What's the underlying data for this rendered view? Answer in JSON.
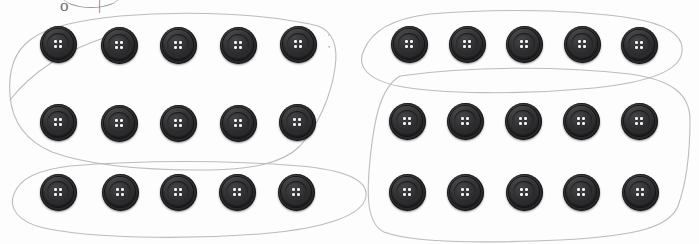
{
  "scene": {
    "title": "Buttons grouping worksheet",
    "description": "Twenty dark four-hole buttons arranged in four rows of five, with faint hand-drawn pencil loops circling groups of buttons",
    "background_color": "#ffffff",
    "width": 699,
    "height": 244
  },
  "colors": {
    "button_body": "#2b2b2d",
    "button_rim": "#333335",
    "button_hole": "#f2f2f2",
    "pencil_line": "#b0b0b0",
    "paper": "#fdfdfd"
  },
  "button_style": {
    "shape": "circle",
    "holes": 4,
    "hole_layout": "2x2",
    "diameter_px": 37
  },
  "handwriting": {
    "visible_fragment": "o     ｜",
    "note": "cut off at top edge of image"
  },
  "annotation_ticks": [
    {
      "name": "tick-right-of-row1-left",
      "x": 327,
      "y": 33,
      "glyph": "ˈ"
    },
    {
      "name": "tick-right-of-row1-left-lower",
      "x": 327,
      "y": 44,
      "glyph": "˺"
    }
  ],
  "button_rows": [
    {
      "name": "left-group-row-1",
      "group": "left",
      "count": 5,
      "y": 44,
      "buttons": [
        {
          "name": "button-l1-1",
          "cx": 58,
          "cy": 44
        },
        {
          "name": "button-l1-2",
          "cx": 119,
          "cy": 45
        },
        {
          "name": "button-l1-3",
          "cx": 178,
          "cy": 45
        },
        {
          "name": "button-l1-4",
          "cx": 238,
          "cy": 45
        },
        {
          "name": "button-l1-5",
          "cx": 298,
          "cy": 44
        }
      ]
    },
    {
      "name": "left-group-row-2",
      "group": "left",
      "count": 5,
      "y": 123,
      "buttons": [
        {
          "name": "button-l2-1",
          "cx": 58,
          "cy": 122
        },
        {
          "name": "button-l2-2",
          "cx": 119,
          "cy": 123
        },
        {
          "name": "button-l2-3",
          "cx": 178,
          "cy": 123
        },
        {
          "name": "button-l2-4",
          "cx": 238,
          "cy": 123
        },
        {
          "name": "button-l2-5",
          "cx": 297,
          "cy": 122
        }
      ]
    },
    {
      "name": "left-group-row-3",
      "group": "left",
      "count": 5,
      "y": 192,
      "buttons": [
        {
          "name": "button-l3-1",
          "cx": 58,
          "cy": 192
        },
        {
          "name": "button-l3-2",
          "cx": 120,
          "cy": 192
        },
        {
          "name": "button-l3-3",
          "cx": 178,
          "cy": 192
        },
        {
          "name": "button-l3-4",
          "cx": 237,
          "cy": 192
        },
        {
          "name": "button-l3-5",
          "cx": 296,
          "cy": 192
        }
      ]
    },
    {
      "name": "right-group-row-1",
      "group": "right",
      "count": 5,
      "y": 44,
      "buttons": [
        {
          "name": "button-r1-1",
          "cx": 409,
          "cy": 44
        },
        {
          "name": "button-r1-2",
          "cx": 467,
          "cy": 44
        },
        {
          "name": "button-r1-3",
          "cx": 524,
          "cy": 44
        },
        {
          "name": "button-r1-4",
          "cx": 582,
          "cy": 44
        },
        {
          "name": "button-r1-5",
          "cx": 639,
          "cy": 45
        }
      ]
    },
    {
      "name": "right-group-row-2",
      "group": "right",
      "count": 5,
      "y": 121,
      "buttons": [
        {
          "name": "button-r2-1",
          "cx": 407,
          "cy": 121
        },
        {
          "name": "button-r2-2",
          "cx": 465,
          "cy": 121
        },
        {
          "name": "button-r2-3",
          "cx": 523,
          "cy": 121
        },
        {
          "name": "button-r2-4",
          "cx": 581,
          "cy": 121
        },
        {
          "name": "button-r2-5",
          "cx": 639,
          "cy": 121
        }
      ]
    },
    {
      "name": "right-group-row-3",
      "group": "right",
      "count": 5,
      "y": 192,
      "buttons": [
        {
          "name": "button-r3-1",
          "cx": 407,
          "cy": 192
        },
        {
          "name": "button-r3-2",
          "cx": 465,
          "cy": 192
        },
        {
          "name": "button-r3-3",
          "cx": 524,
          "cy": 192
        },
        {
          "name": "button-r3-4",
          "cx": 581,
          "cy": 192
        },
        {
          "name": "button-r3-5",
          "cx": 640,
          "cy": 192
        }
      ]
    }
  ],
  "drawn_loops": [
    {
      "name": "loop-left-upper",
      "encloses": "left group rows 1 and 2 (10 buttons)",
      "path": "M 120 16 C 190 10, 270 14, 318 26 C 334 32, 338 48, 335 68 C 331 96, 318 126, 300 146 C 282 164, 250 170, 200 170 C 150 170, 90 166, 52 152 C 24 140, 12 120, 10 96 C 8 72, 14 52, 30 40 C 48 26, 82 20, 120 16 Z"
    },
    {
      "name": "loop-left-lower",
      "encloses": "left group row 3 (5 buttons)",
      "path": "M 70 166 C 140 160, 230 160, 300 166 C 345 170, 368 180, 366 196 C 364 214, 330 228, 260 234 C 180 240, 90 238, 44 228 C 18 222, 8 208, 14 194 C 20 178, 38 170, 70 166 Z"
    },
    {
      "name": "loop-right-upper",
      "encloses": "right group row 1 (5 buttons)",
      "path": "M 430 14 C 500 8, 580 10, 630 18 C 668 24, 684 36, 682 52 C 680 70, 652 82, 594 88 C 520 95, 440 94, 398 86 C 368 80, 356 66, 364 50 C 372 30, 396 18, 430 14 Z"
    },
    {
      "name": "loop-right-lower",
      "encloses": "right group rows 2 and 3 (10 buttons)",
      "path": "M 400 76 C 470 66, 560 66, 630 74 C 672 80, 690 94, 690 120 C 690 152, 686 184, 678 206 C 670 226, 640 236, 560 240 C 470 244, 410 242, 384 232 C 368 224, 366 200, 370 160 C 374 120, 380 88, 400 76 Z"
    },
    {
      "name": "loop-stray-left-tail",
      "encloses": "stray pencil stroke crossing between groups",
      "path": "M 10 100 C 30 74, 64 50, 110 36"
    }
  ]
}
